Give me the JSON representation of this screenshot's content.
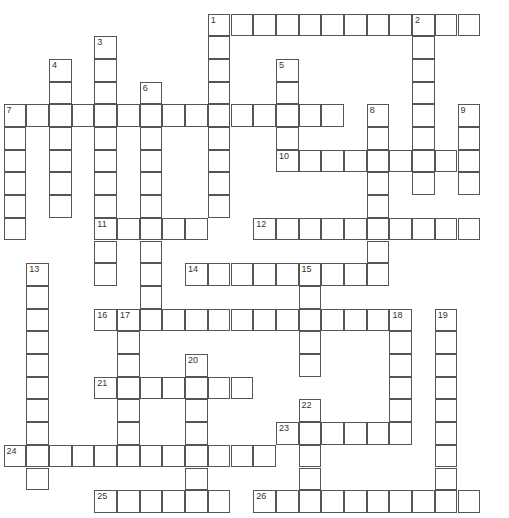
{
  "puzzle": {
    "cell_size": 22.7,
    "origin": [
      4,
      14
    ],
    "entries": [
      {
        "number": "1",
        "dir": "across",
        "row": 0,
        "col": 9,
        "length": 12
      },
      {
        "number": "1",
        "dir": "down",
        "row": 0,
        "col": 9,
        "length": 9
      },
      {
        "number": "2",
        "dir": "down",
        "row": 0,
        "col": 18,
        "length": 8
      },
      {
        "number": "3",
        "dir": "down",
        "row": 1,
        "col": 4,
        "length": 11
      },
      {
        "number": "4",
        "dir": "down",
        "row": 2,
        "col": 2,
        "length": 7
      },
      {
        "number": "5",
        "dir": "down",
        "row": 2,
        "col": 12,
        "length": 5
      },
      {
        "number": "6",
        "dir": "down",
        "row": 3,
        "col": 6,
        "length": 11
      },
      {
        "number": "7",
        "dir": "across",
        "row": 4,
        "col": 0,
        "length": 15
      },
      {
        "number": "7",
        "dir": "down",
        "row": 4,
        "col": 0,
        "length": 6
      },
      {
        "number": "8",
        "dir": "down",
        "row": 4,
        "col": 16,
        "length": 8
      },
      {
        "number": "9",
        "dir": "down",
        "row": 4,
        "col": 20,
        "length": 4
      },
      {
        "number": "10",
        "dir": "across",
        "row": 6,
        "col": 12,
        "length": 9
      },
      {
        "number": "11",
        "dir": "across",
        "row": 9,
        "col": 4,
        "length": 5
      },
      {
        "number": "12",
        "dir": "across",
        "row": 9,
        "col": 11,
        "length": 10
      },
      {
        "number": "13",
        "dir": "down",
        "row": 11,
        "col": 1,
        "length": 10
      },
      {
        "number": "14",
        "dir": "across",
        "row": 11,
        "col": 8,
        "length": 9
      },
      {
        "number": "15",
        "dir": "down",
        "row": 11,
        "col": 13,
        "length": 5
      },
      {
        "number": "16",
        "dir": "across",
        "row": 13,
        "col": 4,
        "length": 14
      },
      {
        "number": "17",
        "dir": "down",
        "row": 13,
        "col": 5,
        "length": 7
      },
      {
        "number": "18",
        "dir": "down",
        "row": 13,
        "col": 17,
        "length": 6
      },
      {
        "number": "19",
        "dir": "down",
        "row": 13,
        "col": 19,
        "length": 9
      },
      {
        "number": "20",
        "dir": "down",
        "row": 15,
        "col": 8,
        "length": 7
      },
      {
        "number": "21",
        "dir": "across",
        "row": 16,
        "col": 4,
        "length": 7
      },
      {
        "number": "22",
        "dir": "down",
        "row": 17,
        "col": 13,
        "length": 5
      },
      {
        "number": "23",
        "dir": "across",
        "row": 18,
        "col": 12,
        "length": 6
      },
      {
        "number": "24",
        "dir": "across",
        "row": 19,
        "col": 0,
        "length": 12
      },
      {
        "number": "25",
        "dir": "across",
        "row": 21,
        "col": 4,
        "length": 6
      },
      {
        "number": "26",
        "dir": "across",
        "row": 21,
        "col": 11,
        "length": 10
      }
    ]
  }
}
